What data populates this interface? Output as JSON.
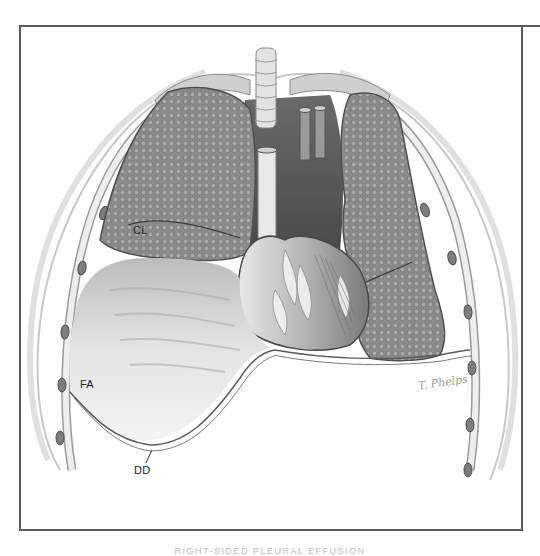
{
  "figure": {
    "title": "Right-sided pleural effusion",
    "caption": "RIGHT-SIDED PLEURAL EFFUSION",
    "signature": "T. Phelps",
    "labels": [
      {
        "id": "CL",
        "text": "CL",
        "meaning": "compressed lung"
      },
      {
        "id": "FA",
        "text": "FA",
        "meaning": "fluid accumulation"
      },
      {
        "id": "DD",
        "text": "DD",
        "meaning": "depressed diaphragm"
      }
    ],
    "colors": {
      "frame": "#5a5a5a",
      "lung": "#8f8f8f",
      "lung_dark": "#5f5f5f",
      "fluid": "#d9d9d9",
      "heart": "#a8a8a8",
      "background": "#ffffff"
    }
  }
}
